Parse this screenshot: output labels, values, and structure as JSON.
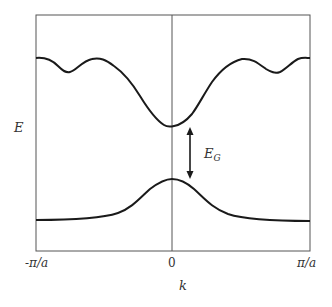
{
  "diagram": {
    "y_axis_label": "E",
    "x_axis_label": "k",
    "x_ticks": [
      "-π/a",
      "0",
      "π/a"
    ],
    "gap_label_main": "E",
    "gap_label_sub": "G",
    "colors": {
      "frame": "#555555",
      "curve": "#1a1a1a",
      "text": "#333333"
    },
    "bands": [
      {
        "name": "conduction band",
        "shape": "minimum at k=0 with oscillating ripples toward zone edges"
      },
      {
        "name": "valence band",
        "shape": "maximum at k=0, flat toward zone edges"
      }
    ],
    "annotation": "double-headed arrow indicating band gap E_G between bands at k=0"
  }
}
